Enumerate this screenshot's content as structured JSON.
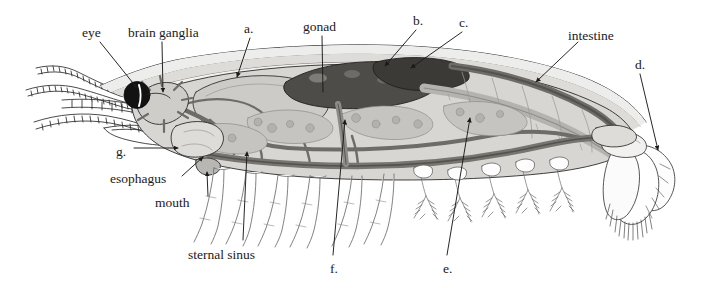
{
  "figure": {
    "background_color": "#ffffff",
    "ink_color": "#1a1a1a",
    "palette": {
      "outline": "#2b2b2b",
      "carapace_light": "#e4e3e1",
      "body_mid": "#cfcdca",
      "organ_gray": "#b9b7b3",
      "vessel_gray": "#8e8c88",
      "dark_gray": "#6e6c68",
      "gonad_dark": "#4a4845",
      "eye_black": "#121212",
      "white": "#ffffff"
    }
  },
  "labels": [
    {
      "id": "eye",
      "text": "eye",
      "x": 82,
      "y": 26,
      "anchor": "start"
    },
    {
      "id": "brain-ganglia",
      "text": "brain ganglia",
      "x": 128,
      "y": 26,
      "anchor": "start"
    },
    {
      "id": "a",
      "text": "a.",
      "x": 244,
      "y": 22,
      "anchor": "start"
    },
    {
      "id": "gonad",
      "text": "gonad",
      "x": 303,
      "y": 20,
      "anchor": "start"
    },
    {
      "id": "b",
      "text": "b.",
      "x": 413,
      "y": 14,
      "anchor": "start"
    },
    {
      "id": "c",
      "text": "c.",
      "x": 459,
      "y": 16,
      "anchor": "start"
    },
    {
      "id": "intestine",
      "text": "intestine",
      "x": 568,
      "y": 29,
      "anchor": "start"
    },
    {
      "id": "d",
      "text": "d.",
      "x": 635,
      "y": 58,
      "anchor": "start"
    },
    {
      "id": "g",
      "text": "g.",
      "x": 116,
      "y": 145,
      "anchor": "start"
    },
    {
      "id": "esophagus",
      "text": "esophagus",
      "x": 110,
      "y": 172,
      "anchor": "start"
    },
    {
      "id": "mouth",
      "text": "mouth",
      "x": 155,
      "y": 196,
      "anchor": "start"
    },
    {
      "id": "sternal-sinus",
      "text": "sternal sinus",
      "x": 188,
      "y": 248,
      "anchor": "start"
    },
    {
      "id": "f",
      "text": "f.",
      "x": 330,
      "y": 262,
      "anchor": "start"
    },
    {
      "id": "e",
      "text": "e.",
      "x": 443,
      "y": 262,
      "anchor": "start"
    }
  ],
  "leaders": [
    {
      "id": "leader-eye",
      "from": [
        100,
        42
      ],
      "to": [
        137,
        88
      ],
      "arrow": true
    },
    {
      "id": "leader-brain-ganglia",
      "from": [
        162,
        42
      ],
      "to": [
        163,
        92
      ],
      "arrow": true
    },
    {
      "id": "leader-a",
      "from": [
        250,
        38
      ],
      "to": [
        237,
        77
      ],
      "arrow": true
    },
    {
      "id": "leader-gonad",
      "from": [
        322,
        36
      ],
      "to": [
        323,
        92
      ],
      "arrow": false
    },
    {
      "id": "leader-b",
      "from": [
        416,
        30
      ],
      "to": [
        385,
        66
      ],
      "arrow": true
    },
    {
      "id": "leader-c",
      "from": [
        462,
        32
      ],
      "to": [
        411,
        68
      ],
      "arrow": true
    },
    {
      "id": "leader-intestine",
      "from": [
        578,
        42
      ],
      "to": [
        536,
        82
      ],
      "arrow": true
    },
    {
      "id": "leader-d",
      "from": [
        640,
        74
      ],
      "to": [
        658,
        150
      ],
      "arrow": true
    },
    {
      "id": "leader-g",
      "from": [
        134,
        148
      ],
      "to": [
        178,
        148
      ],
      "arrow": true
    },
    {
      "id": "leader-esophagus",
      "from": [
        182,
        176
      ],
      "to": [
        203,
        157
      ],
      "arrow": true
    },
    {
      "id": "leader-mouth",
      "from": [
        208,
        196
      ],
      "to": [
        207,
        172
      ],
      "arrow": true
    },
    {
      "id": "leader-sternal-sinus",
      "from": [
        243,
        240
      ],
      "to": [
        247,
        152
      ],
      "arrow": true
    },
    {
      "id": "leader-f",
      "from": [
        333,
        255
      ],
      "to": [
        345,
        120
      ],
      "arrow": true
    },
    {
      "id": "leader-e",
      "from": [
        447,
        255
      ],
      "to": [
        470,
        118
      ],
      "arrow": true
    }
  ],
  "anatomy_parts": [
    "carapace",
    "rostrum",
    "eye",
    "antenna-1",
    "antenna-2",
    "antennule",
    "brain-ganglia",
    "esophagus",
    "mouth",
    "stomach",
    "hepatopancreas",
    "gonad",
    "heart",
    "dorsal-vessel",
    "intestine",
    "sternal-sinus",
    "ventral-nerve-cord",
    "thoracic-legs",
    "pleopods",
    "uropods",
    "telson"
  ]
}
